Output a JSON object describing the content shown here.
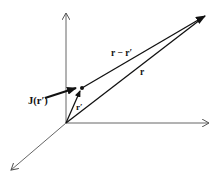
{
  "diagram": {
    "labels": {
      "current_density": "J(r′)",
      "source_vector": "r′",
      "field_vector": "r",
      "separation_vector": "r − r′"
    },
    "colors": {
      "axis": "#555555",
      "vector": "#111111",
      "background": "#ffffff"
    },
    "geometry": {
      "origin": [
        66,
        123
      ],
      "source_point": [
        82,
        88
      ],
      "field_point": [
        207,
        14
      ]
    }
  }
}
